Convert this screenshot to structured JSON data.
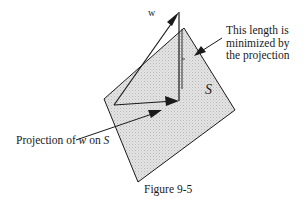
{
  "figure": {
    "caption": "Figure 9-5",
    "vector_label": "w",
    "subspace_label": "S",
    "callout": {
      "line1": "This length is",
      "line2": "minimized by",
      "line3": "the projection"
    },
    "projection_label": {
      "prefix": "Projection of",
      "vector": "w",
      "middle": "on",
      "subspace": "S"
    }
  },
  "colors": {
    "line": "#1a1a1a",
    "plane_fill": "#dcdcdc",
    "background": "#ffffff"
  }
}
